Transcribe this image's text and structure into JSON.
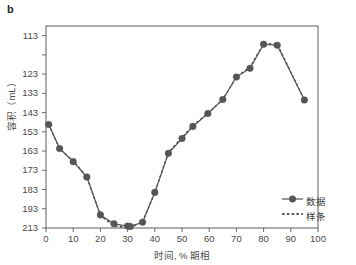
{
  "panel": {
    "label": "b"
  },
  "axes": {
    "x_title": "时间, % 期相",
    "y_title": "容积（mL）",
    "x_ticks": [
      "0",
      "10",
      "20",
      "30",
      "40",
      "50",
      "60",
      "70",
      "80",
      "90",
      "100"
    ],
    "y_ticks": [
      "213",
      "193",
      "183",
      "173",
      "163",
      "153",
      "143",
      "133",
      "123",
      "113"
    ]
  },
  "legend": {
    "data_label": "数据",
    "spline_label": "样条"
  },
  "colors": {
    "marker": "#555555",
    "line": "#5a5a5a",
    "spline": "#2e2e2e",
    "axis": "#6b6b6b",
    "background": "#ffffff",
    "text": "#4a4a4a"
  },
  "chart_data": {
    "type": "line",
    "title": "",
    "xlabel": "时间, % 期相",
    "ylabel": "容积（mL）",
    "xlim": [
      0,
      100
    ],
    "ylim": [
      113,
      218
    ],
    "grid": false,
    "legend_position": "bottom-right",
    "xticks": [
      0,
      10,
      20,
      30,
      40,
      50,
      60,
      70,
      80,
      90,
      100
    ],
    "yticks": [
      113,
      123,
      133,
      143,
      153,
      163,
      173,
      183,
      193,
      213
    ],
    "ytick_note": "the 203 tick position exists on the axis but its label is not rendered",
    "series": [
      {
        "name": "数据",
        "style": "solid-with-markers",
        "x": [
          1,
          5,
          10,
          15,
          20,
          25,
          30,
          31,
          35.5,
          40,
          45,
          50,
          54,
          59.5,
          65,
          70,
          75,
          80,
          85,
          95
        ],
        "y": [
          166.8,
          154.3,
          147.5,
          139.5,
          119.8,
          115.2,
          114.0,
          113.8,
          116.0,
          131.5,
          151.8,
          159.5,
          165.8,
          172.5,
          179.8,
          191.5,
          196.0,
          208.5,
          208.0,
          179.5
        ]
      },
      {
        "name": "样条",
        "style": "dashed",
        "x": [
          1,
          5,
          10,
          15,
          20,
          25,
          30,
          31,
          35.5,
          40,
          45,
          50,
          54,
          59.5,
          65,
          70,
          75,
          80,
          85,
          95
        ],
        "y": [
          166.8,
          154.3,
          147.8,
          139.8,
          119.5,
          114.2,
          113.2,
          113.2,
          116.2,
          131.5,
          152.2,
          160.0,
          166.2,
          172.5,
          179.8,
          191.5,
          196.5,
          208.8,
          208.6,
          179.5
        ]
      }
    ]
  }
}
